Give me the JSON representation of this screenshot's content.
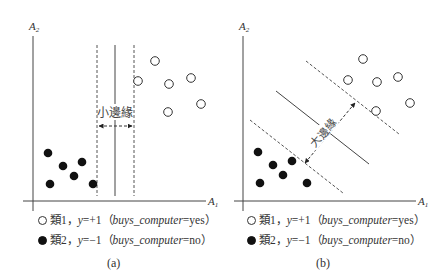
{
  "figure": {
    "panels": [
      {
        "id": "a",
        "caption": "(a)",
        "y_axis_label": "A",
        "y_axis_sub": "2",
        "x_axis_label": "A",
        "x_axis_sub": "1",
        "margin_label": "小邊緣",
        "class1_points": [
          [
            155,
            61
          ],
          [
            138,
            81
          ],
          [
            169,
            84
          ],
          [
            191,
            78
          ],
          [
            168,
            112
          ],
          [
            201,
            104
          ]
        ],
        "class2_points": [
          [
            48,
            153
          ],
          [
            63,
            166
          ],
          [
            82,
            162
          ],
          [
            74,
            176
          ],
          [
            50,
            184
          ],
          [
            93,
            184
          ]
        ]
      },
      {
        "id": "b",
        "caption": "(b)",
        "y_axis_label": "A",
        "y_axis_sub": "2",
        "x_axis_label": "A",
        "x_axis_sub": "1",
        "margin_label": "大邊緣",
        "class1_points": [
          [
            363,
            59
          ],
          [
            348,
            80
          ],
          [
            377,
            82
          ],
          [
            398,
            77
          ],
          [
            376,
            111
          ],
          [
            410,
            103
          ]
        ],
        "class2_points": [
          [
            258,
            152
          ],
          [
            273,
            165
          ],
          [
            292,
            161
          ],
          [
            283,
            175
          ],
          [
            260,
            183
          ],
          [
            307,
            183
          ]
        ]
      }
    ],
    "legend": {
      "class1": {
        "prefix": "類1，",
        "y": "y",
        "eq": "=+1（",
        "attr": "buys_computer",
        "val": "=yes）"
      },
      "class2": {
        "prefix": "類2，",
        "y": "y",
        "eq": "=−1（",
        "attr": "buys_computer",
        "val": "=no）"
      }
    },
    "colors": {
      "line": "#333333",
      "point_fill": "#111111"
    }
  }
}
